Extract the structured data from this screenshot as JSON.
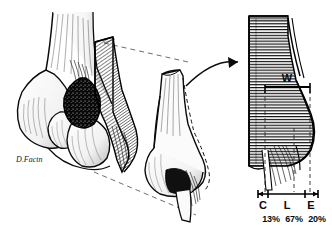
{
  "figure": {
    "name": "distal-humerus-lesion-illustration",
    "type": "anatomical-line-drawing",
    "background_color": "#ffffff",
    "ink_color": "#000000",
    "signature": "D.Factn"
  },
  "panels": {
    "left": {
      "name": "anterior-view-humerus",
      "description": "Anterior view of distal humerus with dark stippled lesion and coronal cut plane"
    },
    "middle": {
      "name": "lateral-view-humerus",
      "description": "Lateral/sagittal view of distal humerus segment"
    },
    "right": {
      "name": "schematic-cross-section",
      "description": "Hatched schematic cross-section with width and zone measurements"
    }
  },
  "annotations": {
    "width_label": "W",
    "zones": [
      {
        "letter": "C",
        "percent": "13%"
      },
      {
        "letter": "L",
        "percent": "67%"
      },
      {
        "letter": "E",
        "percent": "20%"
      }
    ]
  },
  "connectors": {
    "projection_upper": "dashed-projection-line-upper",
    "projection_lower": "dashed-projection-line-lower",
    "arrow": "curved-arrow-to-schematic"
  }
}
